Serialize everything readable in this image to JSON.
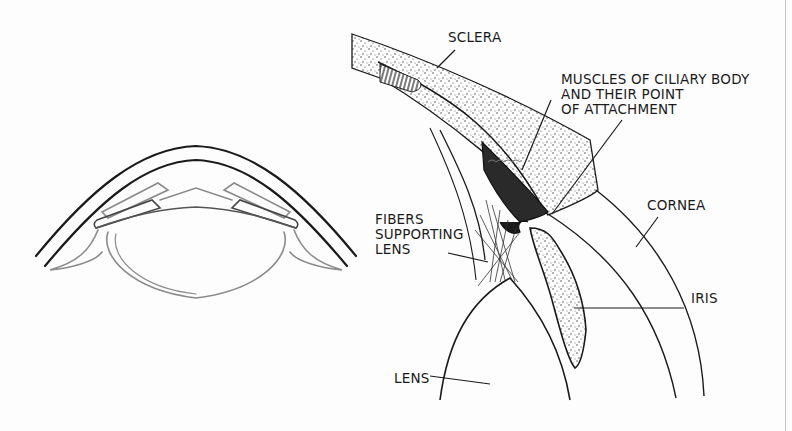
{
  "figure": {
    "left_panel": {
      "description": "Schematic cross-section of the front of the eye"
    },
    "right_panel": {
      "description": "Detailed cross-section of ciliary region"
    },
    "colors": {
      "ink": "#1a1a1a",
      "light_ink": "#8a8a8a",
      "paper": "#fdfdfd"
    }
  },
  "labels": {
    "sclera": "SCLERA",
    "muscles_line1": "MUSCLES OF CILIARY BODY",
    "muscles_line2": "AND THEIR POINT",
    "muscles_line3": "OF ATTACHMENT",
    "cornea": "CORNEA",
    "fibers_line1": "FIBERS",
    "fibers_line2": "SUPPORTING",
    "fibers_line3": "LENS",
    "iris": "IRIS",
    "lens": "LENS"
  }
}
